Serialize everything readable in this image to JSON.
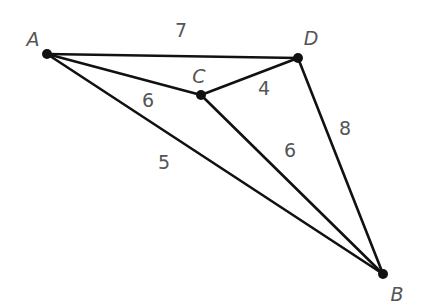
{
  "graph": {
    "nodes": [
      {
        "id": "A",
        "label": "A",
        "x": 47,
        "y": 54,
        "lx": 33,
        "ly": 46
      },
      {
        "id": "B",
        "label": "B",
        "x": 383,
        "y": 274,
        "lx": 397,
        "ly": 301
      },
      {
        "id": "C",
        "label": "C",
        "x": 201,
        "y": 95,
        "lx": 199,
        "ly": 83
      },
      {
        "id": "D",
        "label": "D",
        "x": 298,
        "y": 58,
        "lx": 311,
        "ly": 45
      }
    ],
    "edges": [
      {
        "from": "A",
        "to": "D",
        "weight": "7",
        "lx": 181,
        "ly": 37
      },
      {
        "from": "A",
        "to": "C",
        "weight": "6",
        "lx": 148,
        "ly": 107
      },
      {
        "from": "C",
        "to": "D",
        "weight": "4",
        "lx": 264,
        "ly": 95
      },
      {
        "from": "A",
        "to": "B",
        "weight": "5",
        "lx": 164,
        "ly": 169
      },
      {
        "from": "C",
        "to": "B",
        "weight": "6",
        "lx": 290,
        "ly": 157
      },
      {
        "from": "D",
        "to": "B",
        "weight": "8",
        "lx": 345,
        "ly": 135
      }
    ]
  },
  "colors": {
    "edge": "#111111",
    "node": "#111111",
    "label": "#555555",
    "background": "#ffffff"
  }
}
